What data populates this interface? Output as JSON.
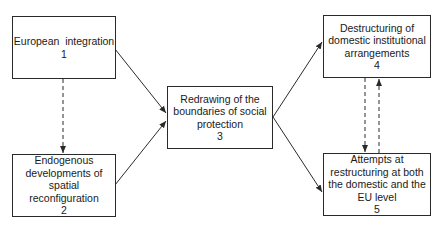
{
  "diagram": {
    "nodes": [
      {
        "id": 1,
        "label": "European  integration",
        "number": "1"
      },
      {
        "id": 2,
        "label": "Endogenous developments of spatial reconfiguration",
        "number": "2"
      },
      {
        "id": 3,
        "label": "Redrawing of the boundaries of social protection",
        "number": "3"
      },
      {
        "id": 4,
        "label": "Destructuring of domestic institutional arrangements",
        "number": "4"
      },
      {
        "id": 5,
        "label": "Attempts at restructuring at both the domestic and the EU level",
        "number": "5"
      }
    ],
    "edges": [
      {
        "from": 1,
        "to": 3,
        "style": "solid"
      },
      {
        "from": 2,
        "to": 3,
        "style": "solid"
      },
      {
        "from": 3,
        "to": 4,
        "style": "solid"
      },
      {
        "from": 3,
        "to": 5,
        "style": "solid"
      },
      {
        "from": 1,
        "to": 2,
        "style": "dashed"
      },
      {
        "from": 4,
        "to": 5,
        "style": "dashed"
      },
      {
        "from": 5,
        "to": 4,
        "style": "dashed"
      }
    ],
    "colors": {
      "line": "#2a2a2a",
      "background": "#ffffff"
    }
  }
}
